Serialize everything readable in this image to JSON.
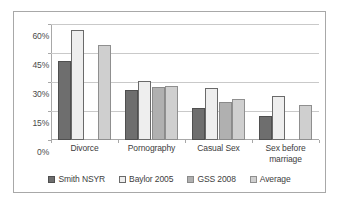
{
  "chart_data": {
    "type": "bar",
    "title": "",
    "xlabel": "",
    "ylabel": "",
    "ylim": [
      0,
      60
    ],
    "y_ticks": [
      "0%",
      "15%",
      "30%",
      "45%",
      "60%"
    ],
    "y_tick_values": [
      0,
      15,
      30,
      45,
      60
    ],
    "grid": true,
    "legend_position": "bottom",
    "categories": [
      "Divorce",
      "Pornography",
      "Casual Sex",
      "Sex before marriage"
    ],
    "series": [
      {
        "name": "Smith NSYR",
        "color": "#6e6e6e",
        "values": [
          41,
          26,
          16.5,
          12.5
        ]
      },
      {
        "name": "Baylor 2005",
        "color": "#eeeeee",
        "values": [
          57,
          30.5,
          27,
          23
        ]
      },
      {
        "name": "GSS 2008",
        "color": "#b0b0b0",
        "values": [
          null,
          27.5,
          19.5,
          null
        ]
      },
      {
        "name": "Average",
        "color": "#cfcfcf",
        "values": [
          49,
          28,
          21,
          18
        ]
      }
    ]
  },
  "legend": {
    "items": [
      {
        "label": "Smith NSYR"
      },
      {
        "label": "Baylor 2005"
      },
      {
        "label": "GSS 2008"
      },
      {
        "label": "Average"
      }
    ]
  }
}
